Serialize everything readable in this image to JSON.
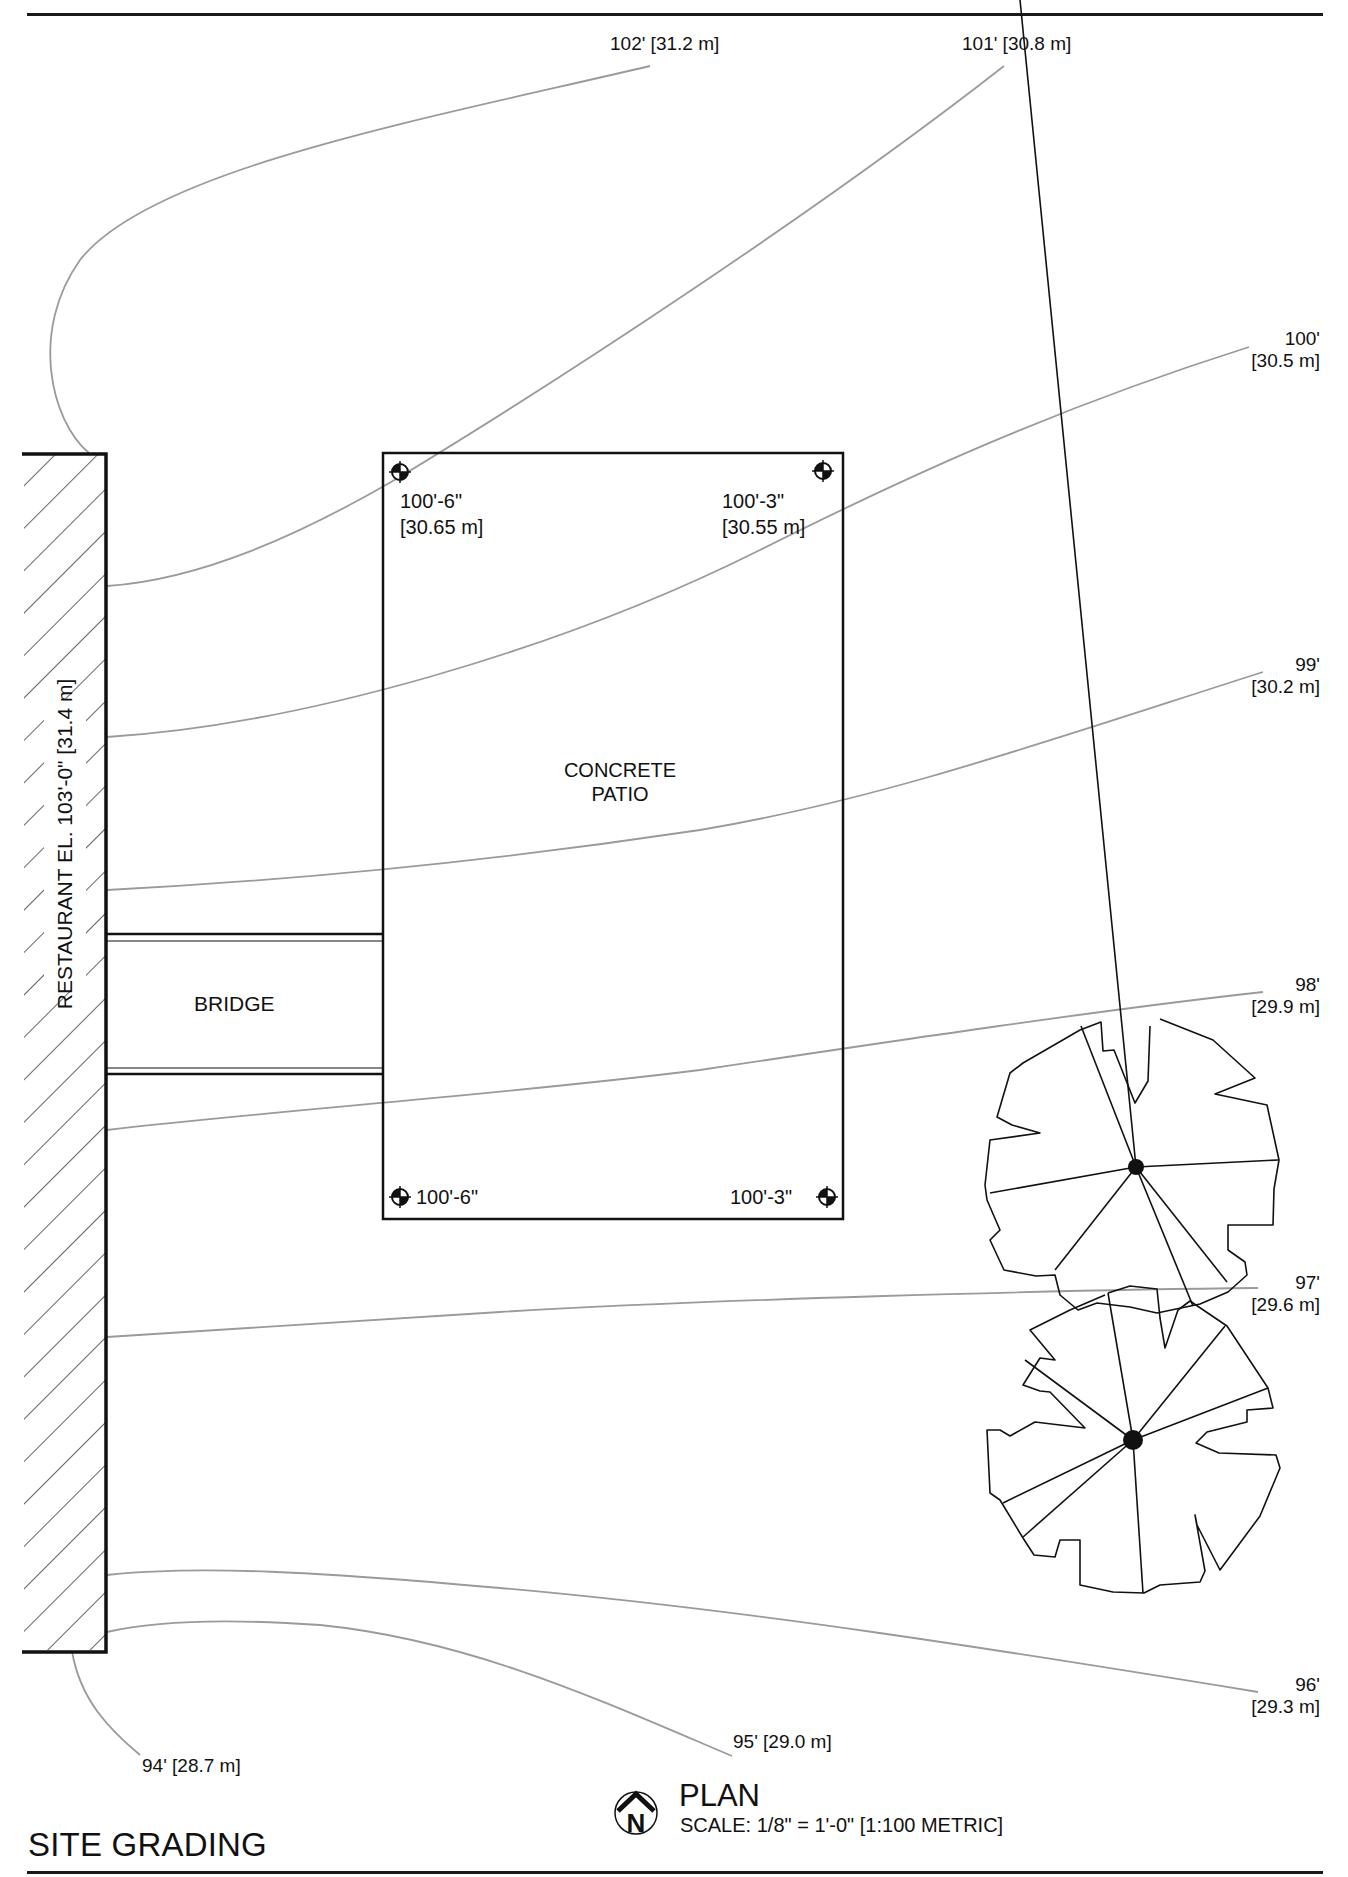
{
  "drawing": {
    "title": "SITE GRADING",
    "view_label": "PLAN",
    "scale_text": "SCALE: 1/8\" = 1'-0\" [1:100 METRIC]",
    "north_arrow": {
      "icon": "north-arrow-icon",
      "letter": "N"
    }
  },
  "structures": {
    "restaurant": {
      "label": "RESTAURANT  EL. 103'-0\" [31.4 m]"
    },
    "bridge": {
      "label": "BRIDGE"
    },
    "patio": {
      "label_line1": "CONCRETE",
      "label_line2": "PATIO"
    }
  },
  "spot_elevations": [
    {
      "id": "patio-top-left",
      "line1": "100'-6\"",
      "line2": "[30.65 m]"
    },
    {
      "id": "patio-top-right",
      "line1": "100'-3\"",
      "line2": "[30.55 m]"
    },
    {
      "id": "patio-bottom-left",
      "line1": "100'-6\""
    },
    {
      "id": "patio-bottom-right",
      "line1": "100'-3\""
    }
  ],
  "contours": [
    {
      "elev_ft": "102'",
      "elev_m": "[31.2 m]",
      "label": "102' [31.2 m]"
    },
    {
      "elev_ft": "101'",
      "elev_m": "[30.8 m]",
      "label": "101' [30.8 m]"
    },
    {
      "elev_ft": "100'",
      "elev_m": "[30.5 m]"
    },
    {
      "elev_ft": "99'",
      "elev_m": "[30.2 m]"
    },
    {
      "elev_ft": "98'",
      "elev_m": "[29.9 m]"
    },
    {
      "elev_ft": "97'",
      "elev_m": "[29.6 m]"
    },
    {
      "elev_ft": "96'",
      "elev_m": "[29.3 m]"
    },
    {
      "elev_ft": "95'",
      "elev_m": "[29.0 m]",
      "label": "95' [29.0 m]"
    },
    {
      "elev_ft": "94'",
      "elev_m": "[28.7 m]",
      "label": "94' [28.7 m]"
    }
  ],
  "trees": [
    {
      "id": "tree-1",
      "icon": "tree-canopy-icon"
    },
    {
      "id": "tree-2",
      "icon": "tree-canopy-icon"
    }
  ],
  "colors": {
    "linework": "#111111",
    "contour": "#9a9a9a"
  }
}
